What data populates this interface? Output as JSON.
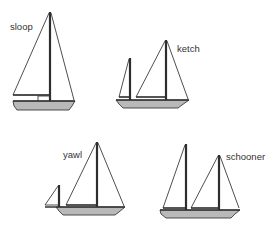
{
  "diagram": {
    "boats": [
      {
        "id": "sloop",
        "label": "sloop"
      },
      {
        "id": "ketch",
        "label": "ketch"
      },
      {
        "id": "yawl",
        "label": "yawl"
      },
      {
        "id": "schooner",
        "label": "schooner"
      }
    ],
    "colors": {
      "background": "#ffffff",
      "lines": "#3a3a3a",
      "hull_fill": "#b9b9b9",
      "text": "#333333"
    }
  }
}
